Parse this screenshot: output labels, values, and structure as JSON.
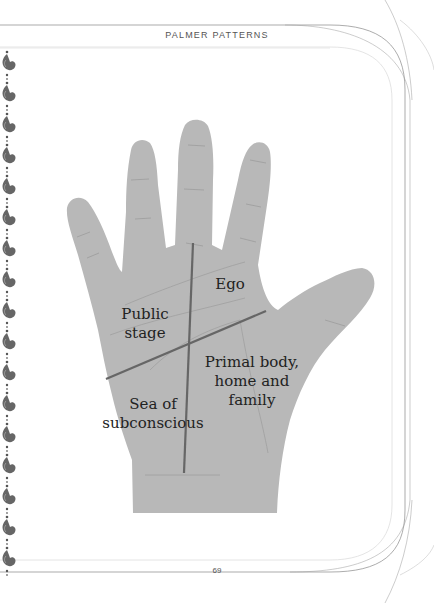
{
  "header": {
    "title": "PALMER PATTERNS"
  },
  "footer": {
    "page_number": "69"
  },
  "diagram": {
    "type": "palm quadrants",
    "regions": [
      {
        "id": "ego",
        "line1": "Ego",
        "line2": "",
        "line3": ""
      },
      {
        "id": "public",
        "line1": "Public",
        "line2": "stage",
        "line3": ""
      },
      {
        "id": "primal",
        "line1": "Primal body,",
        "line2": "home and",
        "line3": "family"
      },
      {
        "id": "sea",
        "line1": "Sea of",
        "line2": "subconscious",
        "line3": ""
      }
    ],
    "colors": {
      "hand": "#b5b5b5",
      "divider": "#666666",
      "crease": "#9a9a9a"
    }
  },
  "decor": {
    "border_icon": "paisley-ornament-icon",
    "count": 17
  }
}
